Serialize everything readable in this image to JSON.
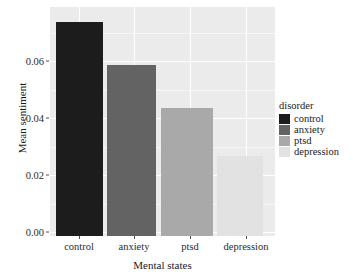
{
  "chart_data": {
    "type": "bar",
    "title": "",
    "xlabel": "Mental states",
    "ylabel": "Mean sentiment",
    "categories": [
      "control",
      "anxiety",
      "ptsd",
      "depression"
    ],
    "values": [
      0.0743,
      0.0593,
      0.0443,
      0.0279
    ],
    "series": [
      {
        "name": "disorder",
        "values": [
          0.0743,
          0.0593,
          0.0443,
          0.0279
        ]
      }
    ],
    "ylim": [
      0.0,
      0.0795
    ],
    "xlim": [
      0,
      4
    ],
    "y_ticks": [
      0.0,
      0.02,
      0.04,
      0.06
    ],
    "y_tick_labels": [
      "0.00",
      "0.02",
      "0.04",
      "0.06"
    ],
    "y_minor_ticks": [
      0.01,
      0.03,
      0.05,
      0.07
    ],
    "x_tick_labels": [
      "control",
      "anxiety",
      "ptsd",
      "depression"
    ],
    "grid": true,
    "grid_color": "#ffffff",
    "panel_background": "#ebebeb",
    "legend_position": "right",
    "legend": {
      "title": "disorder",
      "entries": [
        {
          "label": "control",
          "color": "#1c1c1c"
        },
        {
          "label": "anxiety",
          "color": "#636363"
        },
        {
          "label": "ptsd",
          "color": "#a9a9a9"
        },
        {
          "label": "depression",
          "color": "#e2e2e2"
        }
      ]
    },
    "bar_colors": [
      "#1c1c1c",
      "#636363",
      "#a9a9a9",
      "#e2e2e2"
    ]
  },
  "axes": {
    "y_title": "Mean sentiment",
    "x_title": "Mental states",
    "y_tick_0": "0.00",
    "y_tick_1": "0.02",
    "y_tick_2": "0.04",
    "y_tick_3": "0.06",
    "x_tick_0": "control",
    "x_tick_1": "anxiety",
    "x_tick_2": "ptsd",
    "x_tick_3": "depression"
  },
  "legend": {
    "title": "disorder",
    "item_0": "control",
    "item_1": "anxiety",
    "item_2": "ptsd",
    "item_3": "depression"
  }
}
